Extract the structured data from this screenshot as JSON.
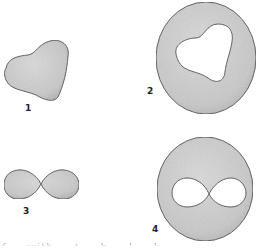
{
  "figure": {
    "panels": [
      {
        "id": "1",
        "label": "1",
        "description": "curved triangular solid blob"
      },
      {
        "id": "2",
        "label": "2",
        "description": "disk with curved triangular hole"
      },
      {
        "id": "3",
        "label": "3",
        "description": "figure-eight (two lobes touching at a point)"
      },
      {
        "id": "4",
        "label": "4",
        "description": "disk with figure-eight hole"
      }
    ],
    "caption_partial": "f ... with ... t ... h ... l ... k"
  },
  "colors": {
    "fill": "#cfcfcf",
    "stroke": "#555555",
    "background": "#ffffff"
  }
}
